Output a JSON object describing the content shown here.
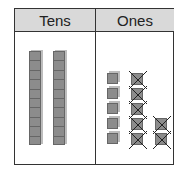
{
  "table": {
    "headers": {
      "tens": "Tens",
      "ones": "Ones"
    }
  },
  "tens_column": {
    "rods": 2,
    "units_per_rod": 10
  },
  "ones_column": {
    "plain_cubes": 5,
    "crossed_out_cubes": 7,
    "crossed_columns": [
      5,
      2
    ]
  },
  "colors": {
    "header_bg": "#d9d9d9",
    "block": "#8c8c8c",
    "border": "#333333"
  }
}
